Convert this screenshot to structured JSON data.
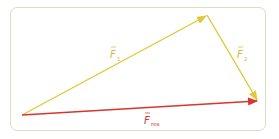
{
  "diagram": {
    "type": "vector-addition",
    "colors": {
      "frame": "#d5dfc9",
      "f1": "#e2c73a",
      "f2": "#e2c73a",
      "fres": "#d9352c",
      "label_f1": "#d6b73a",
      "label_f2": "#d6b73a",
      "label_fres": "#c8362e"
    },
    "points": {
      "origin": [
        22,
        115
      ],
      "f1_tip": [
        207,
        15
      ],
      "f2_tip": [
        258,
        101
      ]
    },
    "vectors": [
      {
        "id": "f1",
        "symbol": "F",
        "subscript": "1",
        "from": "origin",
        "to": "f1_tip"
      },
      {
        "id": "f2",
        "symbol": "F",
        "subscript": "2",
        "from": "f1_tip",
        "to": "f2_tip"
      },
      {
        "id": "fres",
        "symbol": "F",
        "subscript": "res",
        "from": "origin",
        "to": "f2_tip"
      }
    ],
    "labels": {
      "f1": {
        "symbol": "F",
        "subscript": "1"
      },
      "f2": {
        "symbol": "F",
        "subscript": "2"
      },
      "fres": {
        "symbol": "F",
        "subscript": "res"
      }
    }
  }
}
